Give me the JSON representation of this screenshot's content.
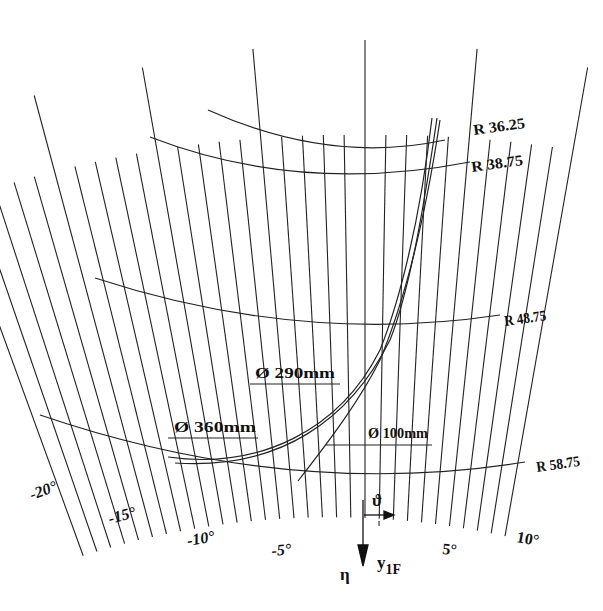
{
  "figure": {
    "type": "polar-grid-diagram",
    "background": "#ffffff",
    "line_color": "#222222"
  },
  "radii": [
    {
      "label": "R 36.25",
      "value": 36.25
    },
    {
      "label": "R 38.75",
      "value": 38.75
    },
    {
      "label": "R 48.75",
      "value": 48.75
    },
    {
      "label": "R 58.75",
      "value": 58.75
    }
  ],
  "angle_ticks": [
    {
      "label": "-20°",
      "value": -20
    },
    {
      "label": "-15°",
      "value": -15
    },
    {
      "label": "-10°",
      "value": -10
    },
    {
      "label": "-5°",
      "value": -5
    },
    {
      "label": "5°",
      "value": 5
    },
    {
      "label": "10°",
      "value": 10
    }
  ],
  "angle_range": {
    "min": -20,
    "max": 10,
    "step": 1
  },
  "curves": [
    {
      "label": "Ø  360mm",
      "diameter_mm": 360
    },
    {
      "label": "Ø  290mm",
      "diameter_mm": 290
    },
    {
      "label": "Ø  100mm",
      "diameter_mm": 100
    }
  ],
  "symbols": {
    "theta": "ϑ",
    "eta": "η",
    "y_axis": "y",
    "y_axis_sub": "1F"
  }
}
